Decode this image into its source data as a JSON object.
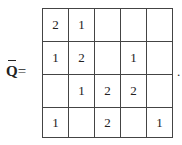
{
  "label": {
    "symbol": "Q",
    "equals": "="
  },
  "matrix": [
    [
      "2",
      "1",
      "",
      "",
      ""
    ],
    [
      "1",
      "2",
      "",
      "1",
      ""
    ],
    [
      "",
      "1",
      "2",
      "2",
      ""
    ],
    [
      "1",
      "",
      "2",
      "",
      "1"
    ]
  ],
  "trailing": "."
}
